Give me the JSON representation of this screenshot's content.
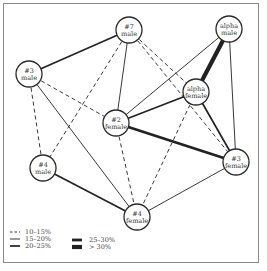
{
  "diagram": {
    "title": "",
    "colors": {
      "line": "#222222",
      "node_fill": "#ffffff",
      "frame": "#8a8a8a"
    },
    "nodes": [
      {
        "id": "m7",
        "line1": "#7",
        "line2": "male",
        "x": 129,
        "y": 30
      },
      {
        "id": "am",
        "line1": "alpha",
        "line2": "male",
        "x": 229,
        "y": 29
      },
      {
        "id": "m3",
        "line1": "#3",
        "line2": "male",
        "x": 29,
        "y": 74
      },
      {
        "id": "af",
        "line1": "alpha",
        "line2": "female",
        "x": 196,
        "y": 92
      },
      {
        "id": "f2",
        "line1": "#2",
        "line2": "female",
        "x": 116,
        "y": 123
      },
      {
        "id": "m4",
        "line1": "#4",
        "line2": "male",
        "x": 43,
        "y": 168
      },
      {
        "id": "f3",
        "line1": "#3",
        "line2": "female",
        "x": 236,
        "y": 162
      },
      {
        "id": "f4",
        "line1": "#4",
        "line2": "female",
        "x": 137,
        "y": 217
      }
    ],
    "edges": [
      {
        "from": "m7",
        "to": "m3",
        "class": "20-25%"
      },
      {
        "from": "m7",
        "to": "f2",
        "class": "15-20%"
      },
      {
        "from": "m7",
        "to": "m4",
        "class": "10-15%"
      },
      {
        "from": "m7",
        "to": "af",
        "class": "10-15%"
      },
      {
        "from": "m7",
        "to": "f3",
        "class": "10-15%"
      },
      {
        "from": "am",
        "to": "af",
        "class": ">30%"
      },
      {
        "from": "am",
        "to": "f2",
        "class": "15-20%"
      },
      {
        "from": "am",
        "to": "f3",
        "class": "15-20%"
      },
      {
        "from": "m3",
        "to": "f2",
        "class": "10-15%"
      },
      {
        "from": "m3",
        "to": "m4",
        "class": "10-15%"
      },
      {
        "from": "m3",
        "to": "f4",
        "class": "15-20%"
      },
      {
        "from": "af",
        "to": "f2",
        "class": "20-25%"
      },
      {
        "from": "af",
        "to": "f3",
        "class": "20-25%"
      },
      {
        "from": "af",
        "to": "f4",
        "class": "10-15%"
      },
      {
        "from": "f2",
        "to": "f3",
        "class": "25-30%"
      },
      {
        "from": "f2",
        "to": "f4",
        "class": "10-15%"
      },
      {
        "from": "m4",
        "to": "f4",
        "class": "20-25%"
      },
      {
        "from": "f3",
        "to": "f4",
        "class": "15-20%"
      }
    ],
    "legend": [
      {
        "class": "10-15%",
        "label": "10–15%"
      },
      {
        "class": "15-20%",
        "label": "15–20%"
      },
      {
        "class": "20-25%",
        "label": "20–25%"
      },
      {
        "class": "25-30%",
        "label": "25–30%"
      },
      {
        "class": ">30%",
        "label": "> 30%"
      }
    ],
    "styles": {
      "10-15%": {
        "width": 0.9,
        "dash": "4,3"
      },
      "15-20%": {
        "width": 0.9,
        "dash": ""
      },
      "20-25%": {
        "width": 1.7,
        "dash": ""
      },
      "25-30%": {
        "width": 2.8,
        "dash": ""
      },
      ">30%": {
        "width": 4.2,
        "dash": ""
      }
    },
    "node_radius": 13
  }
}
